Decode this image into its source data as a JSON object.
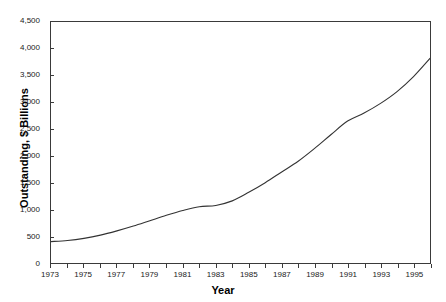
{
  "chart_data": {
    "type": "line",
    "title": "",
    "xlabel": "Year",
    "ylabel": "Outstanding, $ Billions",
    "xlim": [
      1973,
      1996
    ],
    "ylim": [
      0,
      4500
    ],
    "grid": false,
    "legend": null,
    "x_tick_labels": [
      "1973",
      "1975",
      "1977",
      "1979",
      "1981",
      "1983",
      "1985",
      "1987",
      "1989",
      "1991",
      "1993",
      "1995"
    ],
    "x_tick_values": [
      1973,
      1975,
      1977,
      1979,
      1981,
      1983,
      1985,
      1987,
      1989,
      1991,
      1993,
      1995
    ],
    "x_minor_tick_values": [
      1973,
      1974,
      1975,
      1976,
      1977,
      1978,
      1979,
      1980,
      1981,
      1982,
      1983,
      1984,
      1985,
      1986,
      1987,
      1988,
      1989,
      1990,
      1991,
      1992,
      1993,
      1994,
      1995,
      1996
    ],
    "y_tick_labels": [
      "0",
      "500",
      "1,000",
      "1,500",
      "2,000",
      "2,500",
      "3,000",
      "3,500",
      "4,000",
      "4,500"
    ],
    "y_tick_values": [
      0,
      500,
      1000,
      1500,
      2000,
      2500,
      3000,
      3500,
      4000,
      4500
    ],
    "series": [
      {
        "name": "Outstanding",
        "color": "#333333",
        "x": [
          1973,
          1974,
          1975,
          1976,
          1977,
          1978,
          1979,
          1980,
          1981,
          1982,
          1983,
          1984,
          1985,
          1986,
          1987,
          1988,
          1989,
          1990,
          1991,
          1992,
          1993,
          1994,
          1995,
          1996
        ],
        "values": [
          400,
          420,
          460,
          520,
          600,
          690,
          790,
          890,
          980,
          1050,
          1075,
          1160,
          1320,
          1500,
          1700,
          1900,
          2140,
          2400,
          2650,
          2800,
          2980,
          3200,
          3480,
          3820
        ]
      }
    ]
  }
}
